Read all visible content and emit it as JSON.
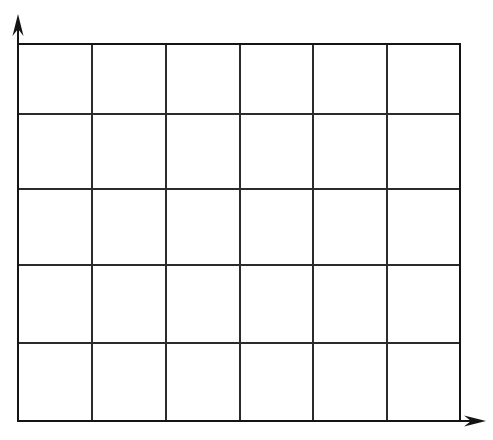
{
  "figure": {
    "background_color": "#ffffff",
    "line_color": "#2b2b2b",
    "border_color": "#141414",
    "axis_color": "#141414",
    "width": 493,
    "height": 440
  },
  "chart_data": {
    "type": "table",
    "title": "",
    "subtitle": "",
    "xlabel": "",
    "ylabel": "",
    "grid": true,
    "legend": null,
    "legend_position": "none",
    "columns": 6,
    "rows": 5,
    "column_headers": [
      "",
      "",
      "",
      "",
      "",
      ""
    ],
    "row_headers": [
      "",
      "",
      "",
      ""
    ],
    "values": [
      [
        "",
        "",
        "",
        "",
        "",
        ""
      ],
      [
        "",
        "",
        "",
        "",
        "",
        ""
      ],
      [
        "",
        "",
        "",
        "",
        "",
        ""
      ],
      [
        "",
        "",
        "",
        "",
        "",
        ""
      ],
      [
        "",
        "",
        "",
        "",
        "",
        ""
      ]
    ],
    "annotations": [],
    "tick_labels_x": [],
    "tick_labels_y": [],
    "x_gridline_positions": [
      18,
      92,
      166,
      240,
      313,
      387,
      460
    ],
    "y_gridline_positions": [
      44,
      114,
      189,
      265,
      343,
      421
    ],
    "xlim": [
      18,
      460
    ],
    "ylim": [
      44,
      421
    ]
  },
  "axes": {
    "y_axis": {
      "name": "y-axis",
      "direction": "up",
      "x": 18,
      "from_y": 421,
      "to_y": 14,
      "arrow": true
    },
    "x_axis": {
      "name": "x-axis",
      "direction": "right",
      "y": 421,
      "from_x": 18,
      "to_x": 486,
      "arrow": true
    }
  }
}
